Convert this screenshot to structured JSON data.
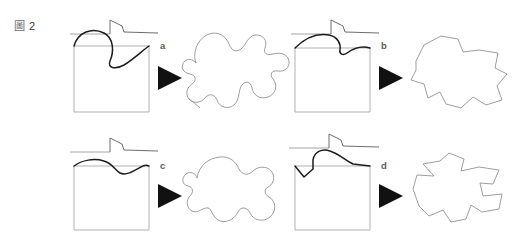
{
  "figure": {
    "caption_glyph": "圖",
    "caption_number": "2",
    "caption_full": "圖 2"
  },
  "colors": {
    "background": "#ffffff",
    "generator_line": "#9a9a9a",
    "generator_mark": "#5c5c5c",
    "square_outline": "#a8a8a8",
    "curve": "#1c1c1c",
    "island_outline": "#8c8c8c",
    "arrow": "#111111",
    "letter": "#5a5a5a"
  },
  "panels": [
    {
      "id": "a",
      "letter": "a",
      "generator_label": "step generator with tall vertical riser and shallow fall",
      "initiator_label": "square initiator",
      "curve_label": "deep sinusoidal generator applied to top edge",
      "result_label": "smooth rounded fractal island with broad lobes",
      "arrow_label": "transforms into"
    },
    {
      "id": "b",
      "letter": "b",
      "generator_label": "step generator with tall vertical riser and shallow fall",
      "initiator_label": "square initiator",
      "curve_label": "arched generator with notch applied to top edge",
      "result_label": "angular polygonal fractal island with blunt points",
      "arrow_label": "transforms into"
    },
    {
      "id": "c",
      "letter": "c",
      "generator_label": "step generator with tall vertical riser and shallow fall",
      "initiator_label": "square initiator",
      "curve_label": "shallow gentle wave applied to top edge",
      "result_label": "soft rounded fractal island with gentle undulations",
      "arrow_label": "transforms into"
    },
    {
      "id": "d",
      "letter": "d",
      "generator_label": "step generator with tall vertical riser and long fall",
      "initiator_label": "square initiator",
      "curve_label": "sharp notched generator with steep peak applied to top edge",
      "result_label": "jagged spiky fractal island with deep notches",
      "arrow_label": "transforms into"
    }
  ]
}
